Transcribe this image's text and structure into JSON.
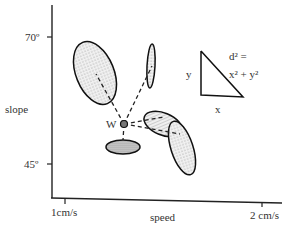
{
  "diagram": {
    "y_axis": {
      "label": "slope",
      "ticks": [
        {
          "label": "70º",
          "y": 37
        },
        {
          "label": "45º",
          "y": 164
        }
      ]
    },
    "x_axis": {
      "label": "speed",
      "ticks": [
        {
          "label": "1cm/s",
          "x": 65
        },
        {
          "label": "2 cm/s",
          "x": 262
        }
      ]
    },
    "center_point": {
      "label": "W",
      "x": 124,
      "y": 124
    },
    "distance_legend": {
      "side_y": "y",
      "side_x": "x",
      "equation_line1": "d² =",
      "equation_line2": "x² + y²"
    },
    "ellipses": [
      {
        "id": "upper-left",
        "cx": 95,
        "cy": 73,
        "rx": 19,
        "ry": 33,
        "rotate": -22,
        "fill": "dotted"
      },
      {
        "id": "upper-thin",
        "cx": 151,
        "cy": 66,
        "rx": 4,
        "ry": 22,
        "rotate": 3,
        "fill": "dotted"
      },
      {
        "id": "right-hatched",
        "cx": 163,
        "cy": 124,
        "rx": 20,
        "ry": 11,
        "rotate": 22,
        "fill": "hatched"
      },
      {
        "id": "right-tall",
        "cx": 182,
        "cy": 148,
        "rx": 11,
        "ry": 28,
        "rotate": -18,
        "fill": "dotted"
      },
      {
        "id": "lower",
        "cx": 123,
        "cy": 147,
        "rx": 17,
        "ry": 7,
        "rotate": 0,
        "fill": "dense"
      }
    ]
  }
}
